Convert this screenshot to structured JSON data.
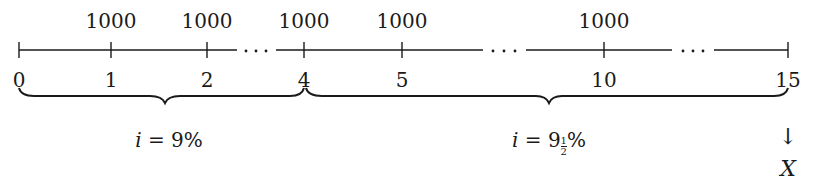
{
  "timeline": {
    "ticks": [
      {
        "label": "0",
        "x": 19
      },
      {
        "label": "1",
        "x": 111
      },
      {
        "label": "2",
        "x": 207
      },
      {
        "label": "4",
        "x": 304
      },
      {
        "label": "5",
        "x": 402
      },
      {
        "label": "10",
        "x": 604
      },
      {
        "label": "15",
        "x": 788
      }
    ],
    "payments": [
      {
        "at": "1",
        "amount": "1000"
      },
      {
        "at": "2",
        "amount": "1000"
      },
      {
        "at": "4",
        "amount": "1000"
      },
      {
        "at": "5",
        "amount": "1000"
      },
      {
        "at": "10",
        "amount": "1000"
      }
    ],
    "ellipsis": [
      "· · ·",
      "· · ·",
      "· · ·"
    ],
    "periods": [
      {
        "from": "0",
        "to": "4",
        "var": "i",
        "eq": " = 9%"
      },
      {
        "from": "4",
        "to": "15",
        "var": "i",
        "eq_whole": " = 9",
        "frac_num": "1",
        "frac_den": "2",
        "eq_suffix": "%"
      }
    ],
    "unknown": {
      "arrow": "↓",
      "label": "X",
      "at": "15"
    }
  }
}
